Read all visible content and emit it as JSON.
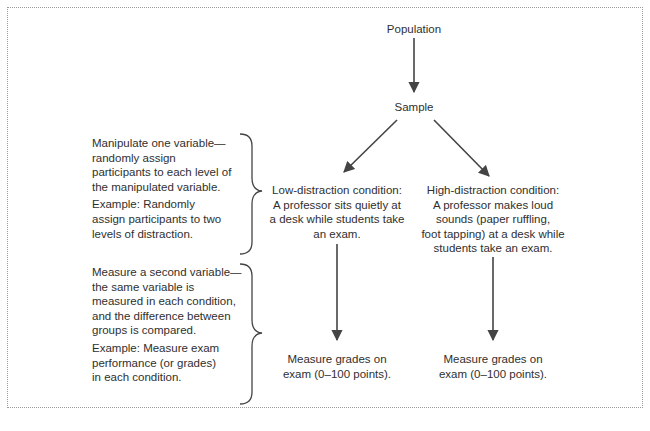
{
  "diagram": {
    "population": "Population",
    "sample": "Sample",
    "left_notes": {
      "manipulate": {
        "text": "Manipulate one variable— randomly assign participants to each level of the manipulated variable.",
        "lines": [
          "Manipulate one variable—",
          "randomly assign",
          "participants to each level of",
          "the manipulated variable."
        ],
        "example_lines": [
          "Example: Randomly",
          "assign participants to two",
          "levels of distraction."
        ]
      },
      "measure": {
        "lines": [
          "Measure a second variable—",
          "the same variable is",
          "measured in each condition,",
          "and the difference between",
          "groups is compared."
        ],
        "example_lines": [
          "Example: Measure exam",
          "performance (or grades)",
          "in each condition."
        ]
      }
    },
    "conditions": [
      {
        "lines": [
          "Low-distraction condition:",
          "A professor sits quietly at",
          "a desk while students take",
          "an exam."
        ],
        "measure_lines": [
          "Measure grades on",
          "exam (0–100 points)."
        ]
      },
      {
        "lines": [
          "High-distraction condition:",
          "A professor makes loud",
          "sounds (paper ruffling,",
          "foot tapping) at a desk while",
          "students take an exam."
        ],
        "measure_lines": [
          "Measure grades on",
          "exam (0–100 points)."
        ]
      }
    ],
    "colors": {
      "arrow": "#444444",
      "text": "#2f2f2f",
      "border": "#9a9a9a"
    }
  }
}
